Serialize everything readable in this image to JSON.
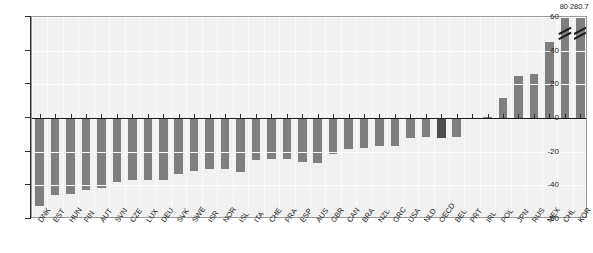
{
  "chart_data": {
    "type": "bar",
    "title": "",
    "subtitle": "",
    "xlabel": "",
    "ylabel": "",
    "ylim": [
      -60,
      60
    ],
    "yticks": [
      60,
      40,
      20,
      0,
      -20,
      -40,
      -60
    ],
    "grid": true,
    "legend": null,
    "orientation": "vertical",
    "categories": [
      "DNK",
      "EST",
      "HUN",
      "FIN",
      "AUT",
      "SVN",
      "CZE",
      "LUX",
      "DEU",
      "SVK",
      "SWE",
      "ISR",
      "NOR",
      "ISL",
      "ITA",
      "CHE",
      "FRA",
      "ESP",
      "AUS",
      "GBR",
      "CAN",
      "BRA",
      "NZL",
      "GRC",
      "USA",
      "NLD",
      "OECD",
      "BEL",
      "PRT",
      "IRL",
      "POL",
      "JPN",
      "RUS",
      "MEX",
      "CHL",
      "KOR"
    ],
    "values": [
      -52,
      -46,
      -45,
      -43,
      -41.5,
      -38,
      -37,
      -37,
      -37,
      -33,
      -31.5,
      -30.5,
      -30.5,
      -32,
      -25,
      -24.5,
      -24.5,
      -26,
      -26.5,
      -21.5,
      -18.5,
      -18,
      -16.5,
      -16.5,
      -12,
      -11,
      -12,
      -11,
      -0.5,
      0.5,
      12,
      25,
      26,
      45,
      80,
      280.7
    ],
    "truncated_bars": [
      {
        "category": "CHL",
        "label": "80"
      },
      {
        "category": "KOR",
        "label": "280.7"
      }
    ],
    "highlighted_category": "OECD",
    "bar_color": "#7f7f7f",
    "highlight_color": "#4d4d4d",
    "plot_background": "#f1f1f1",
    "axis_color": "#2b2b2b",
    "zero_line_color": "#1a1a1a"
  }
}
